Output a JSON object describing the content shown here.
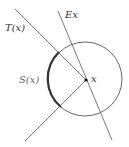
{
  "diagram": {
    "labels": {
      "tangent": "T(x)",
      "normal": "Ex",
      "arc": "S(x)",
      "point": "x"
    },
    "colors": {
      "line": "#555555",
      "circle": "#555555",
      "arc_highlight": "#333333",
      "point": "#111111",
      "label": "#333333"
    }
  }
}
